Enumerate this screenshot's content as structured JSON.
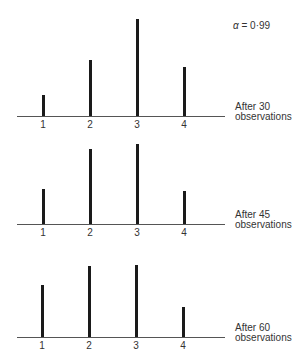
{
  "annotation": {
    "symbol": "α",
    "text": " = 0·99"
  },
  "chart_data": [
    {
      "type": "bar",
      "title": "After 30 observations",
      "categories": [
        "1",
        "2",
        "3",
        "4"
      ],
      "values": [
        21,
        56,
        97,
        49
      ],
      "xlabel": "",
      "ylabel": "",
      "grid": false
    },
    {
      "type": "bar",
      "title": "After 45 observations",
      "categories": [
        "1",
        "2",
        "3",
        "4"
      ],
      "values": [
        35,
        75,
        80,
        33
      ],
      "xlabel": "",
      "ylabel": "",
      "grid": false
    },
    {
      "type": "bar",
      "title": "After 60 observations",
      "categories": [
        "1",
        "2",
        "3",
        "4"
      ],
      "values": [
        52,
        71,
        72,
        30
      ],
      "xlabel": "",
      "ylabel": "",
      "grid": false
    }
  ],
  "panels": [
    {
      "label_line1": "After 30",
      "label_line2": "observations",
      "ticks": [
        "1",
        "2",
        "3",
        "4"
      ]
    },
    {
      "label_line1": "After 45",
      "label_line2": "observations",
      "ticks": [
        "1",
        "2",
        "3",
        "4"
      ]
    },
    {
      "label_line1": "After 60",
      "label_line2": "observations",
      "ticks": [
        "1",
        "2",
        "3",
        "4"
      ]
    }
  ]
}
